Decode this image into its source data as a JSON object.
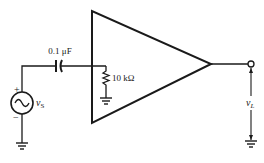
{
  "diagram": {
    "type": "circuit-schematic",
    "components": {
      "source": {
        "label": "v",
        "subscript": "S",
        "polarity_plus": "+",
        "polarity_minus": "−"
      },
      "capacitor": {
        "label": "0.1 μF"
      },
      "resistor": {
        "label": "10 kΩ"
      },
      "amplifier": {
        "shape": "triangle"
      },
      "output": {
        "label": "v",
        "subscript": "L"
      }
    }
  }
}
